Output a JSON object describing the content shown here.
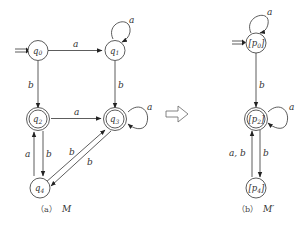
{
  "diagram": {
    "left": {
      "caption_prefix": "（a）",
      "caption_name": "M",
      "states": [
        {
          "id": "q0",
          "label": "q",
          "sub": "0",
          "initial": true,
          "accepting": false
        },
        {
          "id": "q1",
          "label": "q",
          "sub": "1",
          "initial": false,
          "accepting": false
        },
        {
          "id": "q2",
          "label": "q",
          "sub": "2",
          "initial": false,
          "accepting": true
        },
        {
          "id": "q3",
          "label": "q",
          "sub": "3",
          "initial": false,
          "accepting": true
        },
        {
          "id": "q4",
          "label": "q",
          "sub": "4",
          "initial": false,
          "accepting": false
        }
      ],
      "transitions": [
        {
          "from": "q0",
          "to": "q1",
          "label": "a"
        },
        {
          "from": "q1",
          "to": "q1",
          "label": "a"
        },
        {
          "from": "q0",
          "to": "q2",
          "label": "b"
        },
        {
          "from": "q1",
          "to": "q3",
          "label": "b"
        },
        {
          "from": "q2",
          "to": "q3",
          "label": "a"
        },
        {
          "from": "q3",
          "to": "q3",
          "label": "a"
        },
        {
          "from": "q2",
          "to": "q4",
          "label": "b"
        },
        {
          "from": "q4",
          "to": "q2",
          "label": "a"
        },
        {
          "from": "q4",
          "to": "q3",
          "label": "b"
        },
        {
          "from": "q3",
          "to": "q4",
          "label": "b"
        }
      ]
    },
    "arrow_label": "minimization",
    "right": {
      "caption_prefix": "（b）",
      "caption_name": "M′",
      "states": [
        {
          "id": "p0",
          "label": "[p",
          "sub": "0",
          "close": "]",
          "initial": true,
          "accepting": false
        },
        {
          "id": "p2",
          "label": "[p",
          "sub": "2",
          "close": "]",
          "initial": false,
          "accepting": true
        },
        {
          "id": "p4",
          "label": "[p",
          "sub": "4",
          "close": "]",
          "initial": false,
          "accepting": false
        }
      ],
      "transitions": [
        {
          "from": "p0",
          "to": "p0",
          "label": "a"
        },
        {
          "from": "p0",
          "to": "p2",
          "label": "b"
        },
        {
          "from": "p2",
          "to": "p2",
          "label": "a"
        },
        {
          "from": "p2",
          "to": "p4",
          "label": "b"
        },
        {
          "from": "p4",
          "to": "p2",
          "label": "a, b"
        }
      ]
    }
  },
  "labels": {
    "q0_q1": "a",
    "q1_loop": "a",
    "q0_q2": "b",
    "q1_q3": "b",
    "q2_q3": "a",
    "q3_loop": "a",
    "q2_q4": "b",
    "q4_q2": "a",
    "q4_q3": "b",
    "q3_q4": "b",
    "p0_loop": "a",
    "p0_p2": "b",
    "p2_loop": "a",
    "p2_p4": "b",
    "p4_p2": "a, b"
  }
}
